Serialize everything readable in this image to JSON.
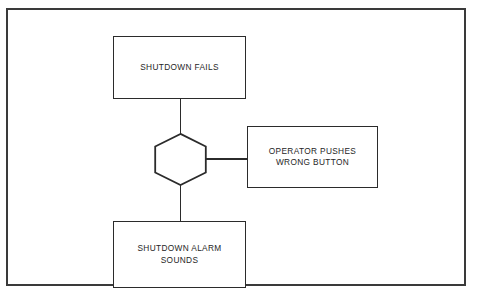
{
  "diagram": {
    "type": "fault-tree",
    "title": "",
    "background_color": "#ffffff",
    "line_color": "#2b2b2b",
    "frame_color": "#3a3a3a",
    "text_color": "#262626",
    "nodes": [
      {
        "id": "shutdown-fails",
        "shape": "rectangle",
        "label": "SHUTDOWN FAILS"
      },
      {
        "id": "gate",
        "shape": "hexagon",
        "label": ""
      },
      {
        "id": "operator-pushes-wrong-button",
        "shape": "rectangle",
        "label": "OPERATOR PUSHES\nWRONG BUTTON"
      },
      {
        "id": "shutdown-alarm-sounds",
        "shape": "rectangle",
        "label": "SHUTDOWN ALARM\nSOUNDS"
      }
    ],
    "connectors": [
      {
        "id": "fails-to-gate",
        "from": "shutdown-fails",
        "to": "gate",
        "orientation": "vertical"
      },
      {
        "id": "gate-to-operator",
        "from": "gate",
        "to": "operator-pushes-wrong-button",
        "orientation": "horizontal"
      },
      {
        "id": "gate-to-alarm",
        "from": "gate",
        "to": "shutdown-alarm-sounds",
        "orientation": "vertical"
      }
    ]
  }
}
